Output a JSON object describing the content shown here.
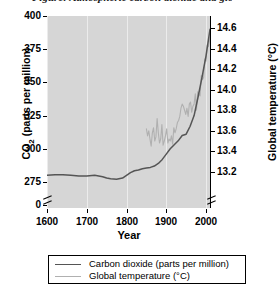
{
  "top_caption_fragment": "Figure: Atmospheric carbon dioxide and global temperature",
  "axes": {
    "x": {
      "title": "Year",
      "ticks": [
        1600,
        1700,
        1800,
        1900,
        2000
      ],
      "tick_labels": [
        "1600",
        "1700",
        "1800",
        "1900",
        "2000"
      ],
      "range": [
        1600,
        2010
      ]
    },
    "y_left": {
      "title": "CO₂ (parts per million)",
      "title_plain": "CO2 (parts per million)",
      "ticks": [
        0,
        275,
        300,
        325,
        350,
        375,
        400
      ],
      "tick_labels": [
        "0",
        "275",
        "300",
        "325",
        "350",
        "375",
        "400"
      ],
      "range": [
        275,
        400
      ],
      "broken_axis": true,
      "break_below": 275
    },
    "y_right": {
      "title": "Global temperature (°C)",
      "ticks": [
        13.2,
        13.4,
        13.6,
        13.8,
        14.0,
        14.2,
        14.4,
        14.6
      ],
      "tick_labels": [
        "13.2",
        "13.4",
        "13.6",
        "13.8",
        "14.0",
        "14.2",
        "14.4",
        "14.6"
      ],
      "range": [
        13.1,
        14.72
      ],
      "broken_axis": true
    }
  },
  "legend": {
    "position": "below-plot",
    "entries": [
      {
        "label": "Carbon dioxide (parts per million)",
        "color": "#555555",
        "series": "co2"
      },
      {
        "label": "Global temperature (°C)",
        "color": "#b0b0b0",
        "series": "temperature"
      }
    ]
  },
  "style": {
    "plot_background": "#d6d6d6",
    "gridline_color": "#ececec",
    "axis_color": "#000000",
    "co2_color": "#555555",
    "temp_color": "#b0b0b0",
    "page_background": "#ffffff",
    "grid": "vertical-only"
  },
  "chart_data": {
    "type": "line",
    "title": "",
    "subtitle": "",
    "xlabel": "Year",
    "ylabel": "CO2 (parts per million)",
    "ylabel_right": "Global temperature (°C)",
    "xlim": [
      1600,
      2010
    ],
    "ylim": [
      275,
      400
    ],
    "ylim_right": [
      13.1,
      14.72
    ],
    "grid": true,
    "legend_position": "bottom",
    "series": [
      {
        "name": "Carbon dioxide (parts per million)",
        "axis": "left",
        "units": "ppm",
        "color": "#555555",
        "x": [
          1600,
          1620,
          1640,
          1660,
          1680,
          1700,
          1720,
          1740,
          1750,
          1760,
          1775,
          1790,
          1800,
          1810,
          1820,
          1830,
          1840,
          1850,
          1860,
          1870,
          1880,
          1890,
          1900,
          1910,
          1920,
          1930,
          1940,
          1950,
          1960,
          1970,
          1980,
          1990,
          2000,
          2005,
          2010
        ],
        "y": [
          280,
          280.5,
          280.5,
          280,
          279.5,
          279.5,
          280,
          279,
          278,
          277.5,
          277,
          278,
          280,
          282,
          283.5,
          284,
          285,
          285.5,
          286,
          287,
          289,
          292,
          296,
          300,
          303,
          306,
          310,
          311,
          317,
          325,
          339,
          354,
          370,
          380,
          390
        ]
      },
      {
        "name": "Global temperature (°C)",
        "axis": "right",
        "units": "°C",
        "color": "#b0b0b0",
        "note": "annual mean, jagged interannual variability; record begins ~1850",
        "x": [
          1850,
          1853,
          1856,
          1859,
          1862,
          1865,
          1868,
          1871,
          1874,
          1877,
          1880,
          1883,
          1886,
          1889,
          1892,
          1895,
          1898,
          1901,
          1904,
          1907,
          1910,
          1913,
          1916,
          1919,
          1922,
          1925,
          1928,
          1931,
          1934,
          1937,
          1940,
          1943,
          1946,
          1949,
          1952,
          1955,
          1958,
          1961,
          1964,
          1967,
          1970,
          1973,
          1976,
          1979,
          1982,
          1985,
          1988,
          1991,
          1994,
          1997,
          2000,
          2003,
          2006,
          2009,
          2012
        ],
        "y": [
          13.62,
          13.55,
          13.6,
          13.52,
          13.45,
          13.58,
          13.63,
          13.5,
          13.54,
          13.72,
          13.58,
          13.48,
          13.52,
          13.66,
          13.46,
          13.5,
          13.55,
          13.62,
          13.48,
          13.52,
          13.5,
          13.55,
          13.47,
          13.63,
          13.58,
          13.62,
          13.68,
          13.7,
          13.74,
          13.82,
          13.86,
          13.84,
          13.8,
          13.76,
          13.82,
          13.74,
          13.86,
          13.88,
          13.78,
          13.84,
          13.86,
          13.96,
          13.8,
          13.98,
          13.96,
          13.94,
          14.14,
          14.1,
          14.12,
          14.3,
          14.28,
          14.44,
          14.42,
          14.48,
          14.58
        ]
      }
    ]
  }
}
